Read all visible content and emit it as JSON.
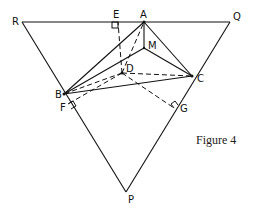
{
  "figure": {
    "caption": "Figure 4",
    "points": {
      "R": {
        "label": "R",
        "x": 22,
        "y": 22
      },
      "Q": {
        "label": "Q",
        "x": 230,
        "y": 22
      },
      "P": {
        "label": "P",
        "x": 126,
        "y": 192
      },
      "E": {
        "label": "E",
        "x": 118,
        "y": 22
      },
      "A": {
        "label": "A",
        "x": 144,
        "y": 22
      },
      "M": {
        "label": "M",
        "x": 144,
        "y": 48
      },
      "D": {
        "label": "D",
        "x": 122,
        "y": 73
      },
      "C": {
        "label": "C",
        "x": 192,
        "y": 76
      },
      "B": {
        "label": "B",
        "x": 64,
        "y": 94
      },
      "F": {
        "label": "F",
        "x": 68,
        "y": 104
      },
      "G": {
        "label": "G",
        "x": 174,
        "y": 108
      }
    },
    "solid_segments": [
      "RQ",
      "QP",
      "PR",
      "AB",
      "AC",
      "AM",
      "MB",
      "MC",
      "BC"
    ],
    "dashed_segments": [
      "DE",
      "DA",
      "DB",
      "DC",
      "DF",
      "DG"
    ],
    "right_angles": [
      "E",
      "F",
      "G"
    ]
  }
}
